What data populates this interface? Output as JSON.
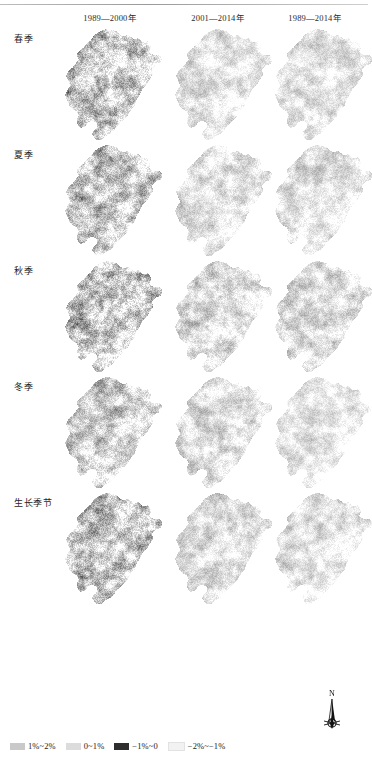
{
  "figure": {
    "type": "map-grid",
    "rows": 5,
    "columns": 3,
    "column_headers": [
      "1989—2000年",
      "2001—2014年",
      "1989—2014年"
    ],
    "row_labels": [
      "春季",
      "夏季",
      "秋季",
      "冬季",
      "生长季节"
    ]
  },
  "legend": {
    "items": [
      {
        "label": "1%~2%",
        "color": "#c9c9c9"
      },
      {
        "label": "0~1%",
        "color": "#dcdcdc"
      },
      {
        "label": "−1%~0",
        "color": "#2e2e2e"
      },
      {
        "label": "−2%~−1%",
        "color": "#f2f2f2"
      }
    ]
  },
  "compass": {
    "label": "N",
    "name": "north-arrow"
  },
  "chart_data": {
    "type": "heatmap",
    "title": "",
    "xlabel": "",
    "ylabel": "",
    "categories": [
      "1989—2000年",
      "2001—2014年",
      "1989—2014年"
    ],
    "rows": [
      "春季",
      "夏季",
      "秋季",
      "冬季",
      "生长季节"
    ],
    "legend_classes": [
      "1%~2%",
      "0~1%",
      "−1%~0",
      "−2%~−1%"
    ],
    "legend_colors": [
      "#c9c9c9",
      "#dcdcdc",
      "#2e2e2e",
      "#f2f2f2"
    ],
    "panel_mean_darkness": [
      [
        0.62,
        0.22,
        0.2
      ],
      [
        0.58,
        0.24,
        0.22
      ],
      [
        0.66,
        0.3,
        0.28
      ],
      [
        0.48,
        0.26,
        0.18
      ],
      [
        0.6,
        0.24,
        0.2
      ]
    ]
  }
}
